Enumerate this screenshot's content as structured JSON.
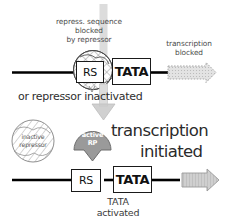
{
  "figure": {
    "background": "#ffffff",
    "ink": "#2b2b2b"
  },
  "panel_top": {
    "caption_line1": "repress. sequence",
    "caption_line2": "blocked",
    "caption_line3": "by repressor",
    "right_caption_line1": "transcription",
    "right_caption_line2": "blocked",
    "rs_box_label": "RS",
    "tata_box_label": "TATA",
    "repressor_fill": "#f2f2f2",
    "blocked_arrow_fill": "#dadada",
    "dna_color": "#000000"
  },
  "divider": {
    "text": "or repressor inactivated"
  },
  "panel_bottom": {
    "inactive_circle_line1": "inactive",
    "inactive_circle_line2": "repressor",
    "polymerase_line1": "active",
    "polymerase_line2": "RP",
    "polymerase_fill": "#9a9a9a",
    "headline_line1": "transcription",
    "headline_line2": "initiated",
    "rs_box_label": "RS",
    "tata_box_label": "TATA",
    "footer_line1": "TATA",
    "footer_line2": "activated",
    "initiated_arrow_fill": "#c8c8c8",
    "dna_color": "#000000"
  },
  "arrows": {
    "down_arrow_fill": "#d5d5d5",
    "down_arrow_name": "downward-flow-arrow"
  }
}
